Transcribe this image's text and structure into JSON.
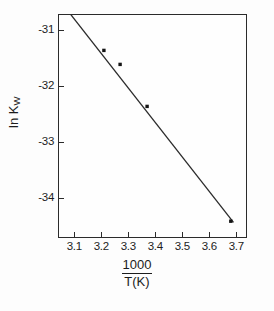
{
  "chart_data": {
    "type": "scatter",
    "title": "",
    "xlabel": "1000 / T(K)",
    "xlabel_numerator": "1000",
    "xlabel_denominator": "T(K)",
    "ylabel": "ln Kw",
    "ylabel_main": "ln K",
    "ylabel_subscript": "W",
    "xlim": [
      3.04,
      3.74
    ],
    "ylim": [
      -34.72,
      -30.72
    ],
    "xticks": [
      3.1,
      3.2,
      3.3,
      3.4,
      3.5,
      3.6,
      3.7
    ],
    "xtick_labels": [
      "3.1",
      "3.2",
      "3.3",
      "3.4",
      "3.5",
      "3.6",
      "3.7"
    ],
    "yticks": [
      -31,
      -32,
      -33,
      -34
    ],
    "ytick_labels": [
      "-31",
      "-32",
      "-33",
      "-34"
    ],
    "grid": false,
    "legend": null,
    "marker": "filled-square",
    "series": [
      {
        "name": "ln Kw vs 1000/T",
        "x": [
          3.1,
          3.21,
          3.27,
          3.37,
          3.68
        ],
        "y": [
          -30.66,
          -31.37,
          -31.62,
          -32.37,
          -34.42
        ]
      }
    ],
    "fit_line": {
      "x": [
        3.05,
        3.69
      ],
      "y": [
        -30.5,
        -34.44
      ]
    }
  },
  "axes": {
    "x_tick_values": [
      "3.1",
      "3.2",
      "3.3",
      "3.4",
      "3.5",
      "3.6",
      "3.7"
    ],
    "y_tick_values": [
      "-31",
      "-32",
      "-33",
      "-34"
    ]
  },
  "colors": {
    "ink": "#2b2b2b",
    "text": "#1c1c1c",
    "background": "#fdfdfd",
    "marker": "#141414"
  }
}
